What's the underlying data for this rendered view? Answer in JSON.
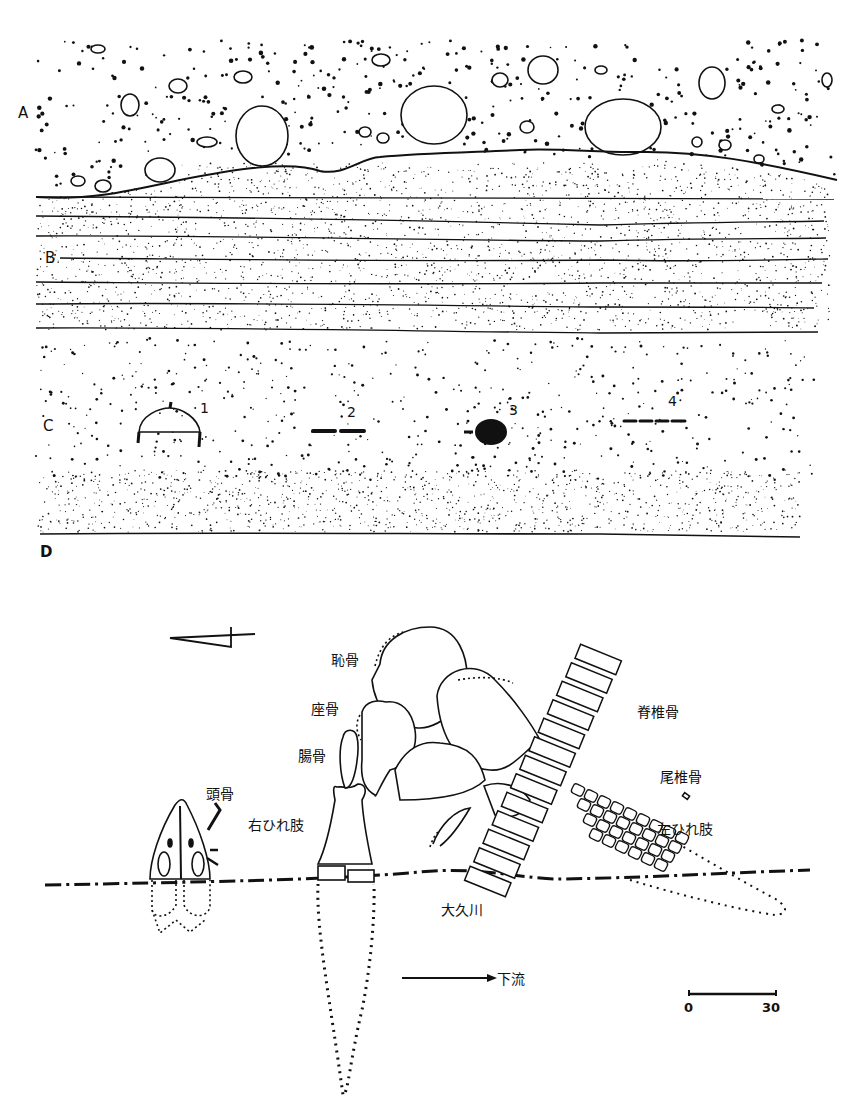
{
  "figure": {
    "upper_section": {
      "title": "stratigraphic-section",
      "layers": [
        {
          "id": "A",
          "label": "A",
          "description": "gravel with boulders"
        },
        {
          "id": "B",
          "label": "B",
          "description": "laminated fine sand"
        },
        {
          "id": "C",
          "label": "C",
          "description": "sand with scattered grains"
        },
        {
          "id": "D",
          "label": "D",
          "description": "base"
        }
      ],
      "specimens": [
        {
          "label": "1",
          "shape": "dome"
        },
        {
          "label": "2",
          "shape": "dashes-2"
        },
        {
          "label": "3",
          "shape": "blob"
        },
        {
          "label": "4",
          "shape": "dashes-4"
        }
      ]
    },
    "lower_plan": {
      "title": "skeleton-plan",
      "bone_labels": {
        "pubis": "恥骨",
        "ischium": "座骨",
        "ilium": "腸骨",
        "skull": "頭骨",
        "right_flipper": "右ひれ肢",
        "vertebrae": "脊椎骨",
        "caudal_vertebrae": "尾椎骨",
        "left_flipper": "左ひれ肢"
      },
      "river": "大久川",
      "flow_label": "下流",
      "scale": {
        "min": "0",
        "max": "30"
      },
      "north_arrow": "north-arrow"
    },
    "colors": {
      "ink": "#111111",
      "paper": "#ffffff"
    }
  }
}
